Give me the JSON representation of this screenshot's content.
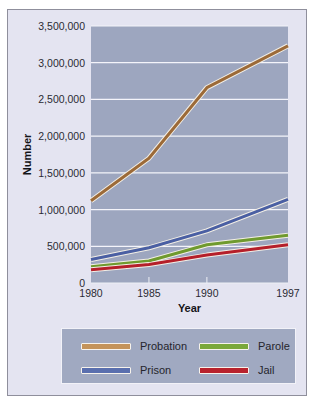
{
  "chart_data": {
    "type": "line",
    "title": "",
    "xlabel": "Year",
    "ylabel": "Number",
    "x": [
      "1980",
      "1985",
      "1990",
      "1997"
    ],
    "ylim": [
      0,
      3500000
    ],
    "yticks": [
      "0",
      "500,000",
      "1,000,000",
      "1,500,000",
      "2,000,000",
      "2,500,000",
      "3,000,000",
      "3,500,000"
    ],
    "grid": true,
    "legend_position": "bottom",
    "series": [
      {
        "name": "Probation",
        "color": "#9c6a38",
        "values": [
          1120000,
          1700000,
          2660000,
          3230000
        ]
      },
      {
        "name": "Prison",
        "color": "#4a5fa3",
        "values": [
          320000,
          480000,
          710000,
          1140000
        ]
      },
      {
        "name": "Parole",
        "color": "#6f9a2e",
        "values": [
          220000,
          300000,
          520000,
          650000
        ]
      },
      {
        "name": "Jail",
        "color": "#b51f2a",
        "values": [
          180000,
          250000,
          380000,
          520000
        ]
      }
    ]
  },
  "legend": {
    "items": [
      {
        "label": "Probation",
        "color": "#c4935a"
      },
      {
        "label": "Parole",
        "color": "#7aa83a"
      },
      {
        "label": "Prison",
        "color": "#5a6fae"
      },
      {
        "label": "Jail",
        "color": "#b8222d"
      }
    ]
  },
  "colors": {
    "panel_bg": "#e4e4f1",
    "plot_bg": "#9da6bf",
    "grid": "#f4f4fa"
  }
}
